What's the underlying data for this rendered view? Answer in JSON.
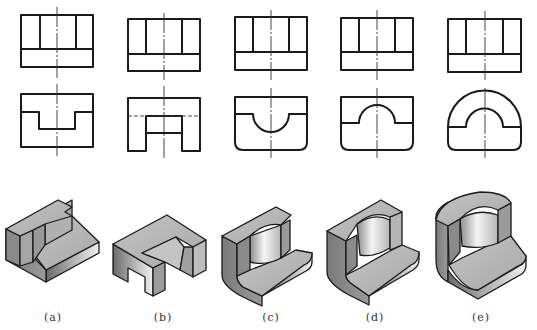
{
  "figure": {
    "rows": [
      "top-view",
      "front-view",
      "isometric"
    ],
    "variants": [
      {
        "id": "a",
        "label": "(a)",
        "front_feature": "rectangular notch (stepped slot)"
      },
      {
        "id": "b",
        "label": "(b)",
        "front_feature": "rectangular through slot with hidden line"
      },
      {
        "id": "c",
        "label": "(c)",
        "front_feature": "semicircular recess, rounded bottom corners"
      },
      {
        "id": "d",
        "label": "(d)",
        "front_feature": "semicircular boss cut-out, rounded bottom corners"
      },
      {
        "id": "e",
        "label": "(e)",
        "front_feature": "arched top with semicircular cut-out"
      }
    ]
  },
  "colors": {
    "line": "#1a1a1a",
    "shade_light": "#e6e6e6",
    "shade_mid": "#a9a9a9",
    "shade_dark": "#6e6e6e",
    "background": "#ffffff"
  }
}
